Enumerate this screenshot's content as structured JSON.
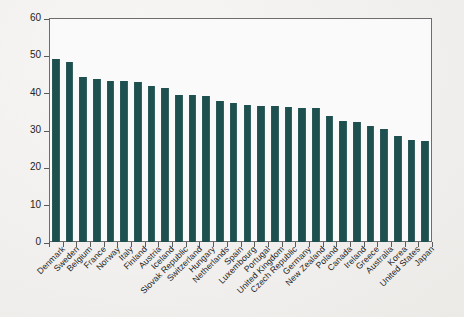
{
  "chart_data": {
    "type": "bar",
    "title": "",
    "subtitle": "",
    "xlabel": "",
    "ylabel": "Percent of GDP",
    "ylim": [
      0,
      60
    ],
    "yticks": [
      0,
      10,
      20,
      30,
      40,
      50,
      60
    ],
    "grid": false,
    "legend": "none",
    "bar_color": "#1f5050",
    "orientation": "vertical",
    "x_tick_label_rotation": -45,
    "categories": [
      "Denmark",
      "Sweden",
      "Belgium",
      "France",
      "Norway",
      "Italy",
      "Finland",
      "Austria",
      "Iceland",
      "Slovak Republic",
      "Switzerland",
      "Hungary",
      "Netherlands",
      "Spain",
      "Luxembourg",
      "Portugal",
      "United Kingdom",
      "Czech Republic",
      "Germany",
      "New Zealand",
      "Poland",
      "Canada",
      "Ireland",
      "Greece",
      "Australia",
      "Korea",
      "United States",
      "Japan"
    ],
    "values": [
      49.0,
      48.2,
      44.3,
      43.6,
      43.2,
      43.2,
      42.8,
      41.9,
      41.2,
      39.5,
      39.4,
      39.0,
      37.7,
      37.3,
      36.7,
      36.4,
      36.3,
      36.1,
      36.0,
      35.9,
      33.8,
      32.4,
      32.2,
      31.0,
      30.3,
      28.4,
      27.3,
      27.0
    ]
  },
  "axis": {
    "y_title": "Percent of GDP",
    "y_tick_labels": [
      "0",
      "10",
      "20",
      "30",
      "40",
      "50",
      "60"
    ]
  }
}
